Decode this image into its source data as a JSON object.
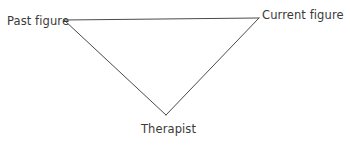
{
  "diagram": {
    "background_color": "#ffffff",
    "line_color": "#4a4a4a",
    "text_color": "#3a3a3a",
    "shape": "inverted-triangle",
    "nodes": [
      {
        "id": "past-figure",
        "label": "Past figure",
        "position": "top-left",
        "vertex": {
          "x": 64,
          "y": 20
        }
      },
      {
        "id": "current-figure",
        "label": "Current figure",
        "position": "top-right",
        "vertex": {
          "x": 259,
          "y": 18
        }
      },
      {
        "id": "therapist",
        "label": "Therapist",
        "position": "bottom",
        "vertex": {
          "x": 166,
          "y": 115
        }
      }
    ],
    "edges": [
      {
        "id": "edge-past-to-current",
        "from": "past-figure",
        "to": "current-figure"
      },
      {
        "id": "edge-current-to-therapist",
        "from": "current-figure",
        "to": "therapist"
      },
      {
        "id": "edge-therapist-to-past",
        "from": "therapist",
        "to": "past-figure"
      }
    ]
  }
}
